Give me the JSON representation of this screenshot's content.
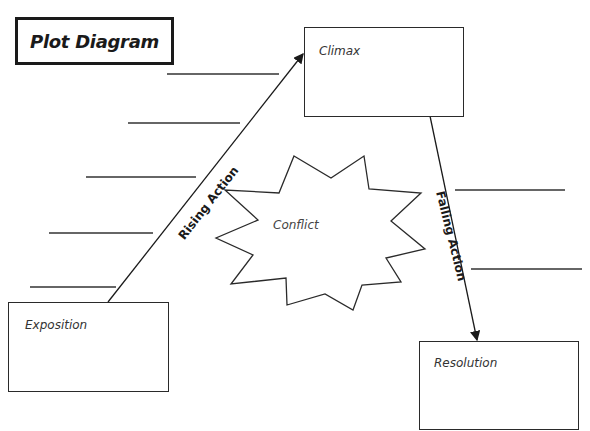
{
  "title": "Plot Diagram",
  "boxes": {
    "climax": "Climax",
    "exposition": "Exposition",
    "resolution": "Resolution"
  },
  "conflict": "Conflict",
  "arrows": {
    "rising": "Rising Action",
    "falling": "Falling Action"
  },
  "blank_lines": {
    "left_count": 5,
    "right_count": 2
  }
}
